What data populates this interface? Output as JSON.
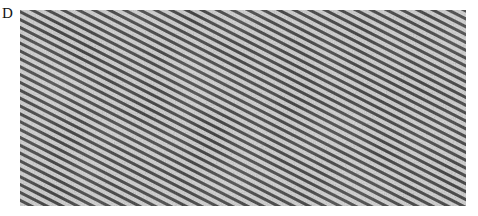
{
  "figure": {
    "panel_label": "D",
    "image": {
      "type": "grayscale micrograph",
      "description": "diagonal striped lattice texture",
      "stripe_angle_deg": 27,
      "stripe_spacing_px": 7
    },
    "colors": {
      "background": "#ffffff",
      "stripe_dark": "#3a3a3a",
      "stripe_light": "#d8d8d8"
    }
  }
}
